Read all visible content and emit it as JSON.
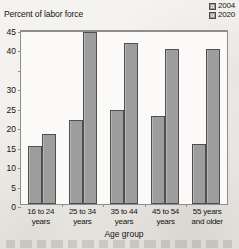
{
  "chart_data": {
    "type": "bar",
    "title": "",
    "ylabel": "Percent of labor force",
    "xlabel": "Age group",
    "categories": [
      "16 to 24 years",
      "25 to 34 years",
      "35 to 44 years",
      "45 to 54 years",
      "55 years and older"
    ],
    "series": [
      {
        "name": "2004",
        "values": [
          15.2,
          21.9,
          24.6,
          23.1,
          15.6
        ],
        "color": "#9d9d9d"
      },
      {
        "name": "2020",
        "values": [
          18.3,
          45.0,
          42.0,
          40.6,
          40.6
        ],
        "color": "#9d9d9d"
      }
    ],
    "ylim": [
      0,
      45
    ],
    "yticks": [
      0,
      5,
      10,
      15,
      20,
      25,
      30,
      35,
      40,
      45
    ],
    "ytick_labels": [
      "0",
      "5",
      "10",
      "15",
      "20",
      "25",
      "30",
      "",
      "40",
      "45"
    ],
    "grid": false,
    "legend_position": "top-right"
  },
  "legend": {
    "items": [
      {
        "label": "2004"
      },
      {
        "label": "2020"
      }
    ]
  },
  "axis": {
    "y_title": "Percent of labor force",
    "x_title": "Age group"
  }
}
